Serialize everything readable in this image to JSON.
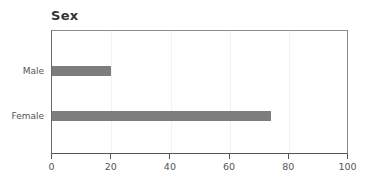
{
  "chart_data": {
    "type": "bar",
    "orientation": "horizontal",
    "title": "Sex",
    "categories": [
      "Male",
      "Female"
    ],
    "values": [
      20,
      73.7
    ],
    "xlabel": "",
    "ylabel": "",
    "xlim": [
      0,
      100
    ],
    "xticks": [
      "0",
      "20",
      "40",
      "60",
      "80",
      "100"
    ],
    "grid": true,
    "legend": null,
    "bar_color": "#7d7d7d"
  }
}
